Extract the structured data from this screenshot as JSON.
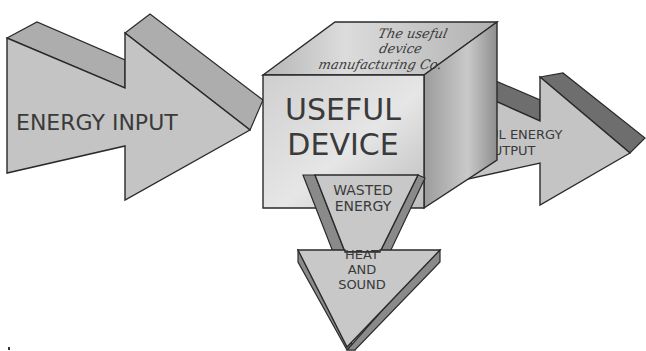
{
  "diagram": {
    "type": "energy-flow",
    "input": {
      "label": "ENERGY INPUT"
    },
    "device": {
      "label_line1": "USEFUL",
      "label_line2": "DEVICE",
      "maker_line1": "The useful",
      "maker_line2": "device",
      "maker_line3": "manufacturing Co."
    },
    "output": {
      "label_line1": "USEFUL ENERGY",
      "label_line2": "OUTPUT"
    },
    "waste": {
      "label_line1": "WASTED",
      "label_line2": "ENERGY",
      "form_line1": "HEAT",
      "form_line2": "AND",
      "form_line3": "SOUND"
    },
    "colors": {
      "arrow_face": "#c4c4c4",
      "arrow_top": "#adadad",
      "arrow_dark": "#6e6e6e",
      "cube_front": "#d6d6d6",
      "cube_top": "#c2c2c2",
      "cube_side": "#a9a9a9",
      "stroke": "#2a2a2a"
    }
  }
}
